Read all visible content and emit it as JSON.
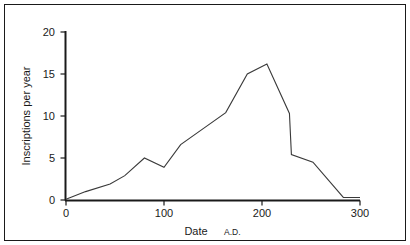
{
  "chart_data": {
    "type": "line",
    "title": "",
    "xlabel": "Date A.D.",
    "xlabel_main": "Date",
    "xlabel_suffix": "A.D.",
    "ylabel": "Inscriptions per year",
    "xlim": [
      0,
      300
    ],
    "ylim": [
      0,
      20
    ],
    "xticks": [
      0,
      100,
      200,
      300
    ],
    "xtick_labels": [
      "0",
      "100",
      "200",
      "300"
    ],
    "yticks": [
      0,
      5,
      10,
      15,
      20
    ],
    "ytick_labels": [
      "0",
      "5",
      "10",
      "15",
      "20"
    ],
    "grid": false,
    "legend": false,
    "line_color": "#3a3a3a",
    "axis_color": "#1a1a1a",
    "background": "#ffffff",
    "series": [
      {
        "name": "Inscriptions per year",
        "x": [
          0,
          20,
          45,
          60,
          80,
          100,
          117,
          140,
          163,
          185,
          205,
          228,
          230,
          252,
          283,
          300
        ],
        "y": [
          0.1,
          1.0,
          1.9,
          2.9,
          5.0,
          3.9,
          6.6,
          8.5,
          10.4,
          15.0,
          16.2,
          10.3,
          5.4,
          4.5,
          0.3,
          0.3
        ]
      }
    ]
  },
  "axes": {
    "y_label_text": "Inscriptions per year",
    "x_label_text": "Date",
    "x_label_era": "A.D."
  },
  "frame": {
    "border_color": "#1a1a1a"
  }
}
